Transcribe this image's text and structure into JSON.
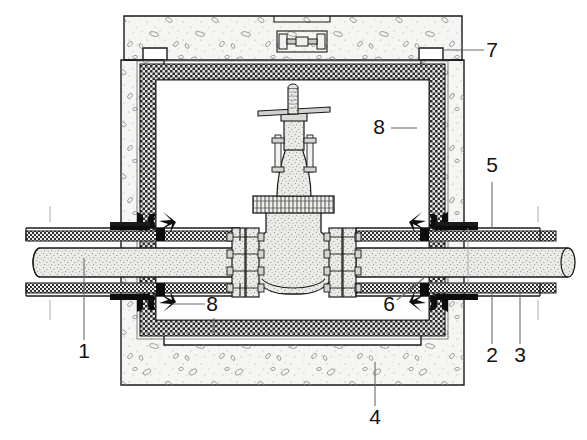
{
  "diagram": {
    "type": "engineering-cross-section",
    "canvas": {
      "width": 587,
      "height": 440
    },
    "colors": {
      "line": "#1a1a1a",
      "concrete_fill": "#f4f4f2",
      "concrete_aggregate": "#8d8d8d",
      "insulation_fill": "#d8d8d8",
      "insulation_checker": "#2a2a2a",
      "pipe_fill": "#e8e8e6",
      "pipe_stipple": "#7a7a7a",
      "valve_fill": "#ebebe9",
      "seal_black": "#0d0d0d",
      "leader_line": "#6b6b6b",
      "background": "#ffffff"
    }
  },
  "callouts": [
    {
      "id": "1",
      "label": "1",
      "x": 84,
      "y": 358,
      "target": "carrier-pipe",
      "leader": {
        "x1": 84,
        "y1": 340,
        "x2": 84,
        "y2": 258
      }
    },
    {
      "id": "2",
      "label": "2",
      "x": 492,
      "y": 362,
      "target": "pipe-insulation",
      "leader": {
        "x1": 492,
        "y1": 344,
        "x2": 492,
        "y2": 290
      }
    },
    {
      "id": "3",
      "label": "3",
      "x": 520,
      "y": 362,
      "target": "pipe-outer-jacket",
      "leader": {
        "x1": 520,
        "y1": 344,
        "x2": 520,
        "y2": 290
      }
    },
    {
      "id": "4",
      "label": "4",
      "x": 375,
      "y": 424,
      "target": "concrete-base-slab",
      "leader": {
        "x1": 375,
        "y1": 406,
        "x2": 375,
        "y2": 362
      }
    },
    {
      "id": "5",
      "label": "5",
      "x": 492,
      "y": 172,
      "target": "waterproofing-flashing",
      "leader": {
        "x1": 492,
        "y1": 182,
        "x2": 492,
        "y2": 228
      }
    },
    {
      "id": "6",
      "label": "6",
      "x": 389,
      "y": 311,
      "target": "wall-penetration-seal",
      "leader": {
        "x1": 397,
        "y1": 300,
        "x2": 424,
        "y2": 278
      }
    },
    {
      "id": "7",
      "label": "7",
      "x": 492,
      "y": 57,
      "target": "chamber-cover-slab",
      "leader": {
        "x1": 484,
        "y1": 50,
        "x2": 443,
        "y2": 50
      }
    },
    {
      "id": "8a",
      "label": "8",
      "x": 379,
      "y": 134,
      "target": "chamber-insulation-lining-right",
      "leader": {
        "x1": 391,
        "y1": 128,
        "x2": 417,
        "y2": 128
      }
    },
    {
      "id": "8b",
      "label": "8",
      "x": 212,
      "y": 311,
      "target": "chamber-insulation-lining-left",
      "leader": {
        "x1": 205,
        "y1": 304,
        "x2": 172,
        "y2": 304
      },
      "leader2": {
        "x1": 214,
        "y1": 318,
        "x2": 214,
        "y2": 334
      }
    }
  ],
  "parts": [
    {
      "key": "carrier-pipe",
      "name": "Carrier pipe (medium pipe)"
    },
    {
      "key": "pipe-insulation",
      "name": "Pipe thermal insulation"
    },
    {
      "key": "pipe-outer-jacket",
      "name": "Pipe outer protective jacket"
    },
    {
      "key": "concrete-base-slab",
      "name": "Concrete chamber base / walls"
    },
    {
      "key": "waterproofing-flashing",
      "name": "Waterproofing flashing collar"
    },
    {
      "key": "wall-penetration-seal",
      "name": "Wall penetration sealing gland"
    },
    {
      "key": "chamber-cover-slab",
      "name": "Removable concrete cover slab"
    },
    {
      "key": "chamber-insulation-lining",
      "name": "Chamber insulation lining"
    },
    {
      "key": "gate-valve",
      "name": "Flanged gate valve"
    },
    {
      "key": "valve-handwheel",
      "name": "Valve operating stem and lever"
    },
    {
      "key": "lifting-handle",
      "name": "Cover slab lifting handle"
    }
  ]
}
